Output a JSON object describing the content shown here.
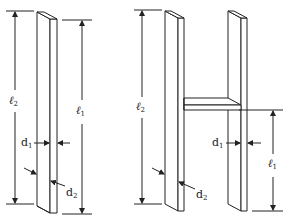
{
  "diagram": {
    "colors": {
      "line": "#222222",
      "background": "#ffffff"
    },
    "left_figure": {
      "name": "single-bar",
      "labels": {
        "l2": {
          "base": "ℓ",
          "sub": "2"
        },
        "l1": {
          "base": "ℓ",
          "sub": "1"
        },
        "d1": {
          "base": "d",
          "sub": "1"
        },
        "d2": {
          "base": "d",
          "sub": "2"
        }
      }
    },
    "right_figure": {
      "name": "h-structure",
      "labels": {
        "l2": {
          "base": "ℓ",
          "sub": "2"
        },
        "l1": {
          "base": "ℓ",
          "sub": "1"
        },
        "d1": {
          "base": "d",
          "sub": "1"
        },
        "d2": {
          "base": "d",
          "sub": "2"
        }
      }
    }
  }
}
